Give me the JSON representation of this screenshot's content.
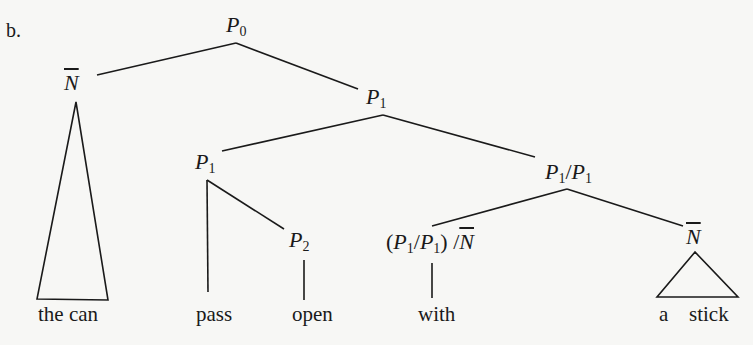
{
  "label": "b.",
  "nodes": {
    "root": {
      "cat": "P",
      "sub": "0"
    },
    "subject": {
      "cat": "N",
      "bar": true
    },
    "vp": {
      "cat": "P",
      "sub": "1"
    },
    "verb_complex": {
      "cat": "P",
      "sub": "1"
    },
    "modifier": {
      "cat1": "P",
      "sub1": "1",
      "slash": "/",
      "cat2": "P",
      "sub2": "1"
    },
    "p2": {
      "cat": "P",
      "sub": "2"
    },
    "prep": {
      "open": "(",
      "cat1": "P",
      "sub1": "1",
      "slash": "/",
      "cat2": "P",
      "sub2": "1",
      "close": ")",
      "slash2": "/",
      "cat3": "N"
    },
    "object": {
      "cat": "N",
      "bar": true
    }
  },
  "leaves": {
    "subject": "the can",
    "verb": "pass",
    "particle": "open",
    "prep": "with",
    "object_det": "a",
    "object_noun": "stick"
  },
  "colors": {
    "ink": "#1a1a1a",
    "paper": "#f7f7f5"
  }
}
